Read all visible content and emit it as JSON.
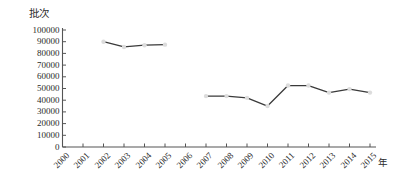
{
  "chart_data": {
    "type": "line",
    "title": "",
    "subtitle": "",
    "ylabel": "批次",
    "xlabel": "年",
    "categories": [
      "2000",
      "2001",
      "2002",
      "2003",
      "2004",
      "2005",
      "2006",
      "2007",
      "2008",
      "2009",
      "2010",
      "2011",
      "2012",
      "2013",
      "2014",
      "2015"
    ],
    "x": [
      2000,
      2001,
      2002,
      2003,
      2004,
      2005,
      2006,
      2007,
      2008,
      2009,
      2010,
      2011,
      2012,
      2013,
      2014,
      2015
    ],
    "values": [
      null,
      null,
      90000,
      85500,
      87000,
      87500,
      null,
      43500,
      43500,
      42000,
      35000,
      52500,
      52500,
      46500,
      49500,
      46500
    ],
    "series": [
      {
        "name": "批次",
        "values": [
          null,
          null,
          90000,
          85500,
          87000,
          87500,
          null,
          43500,
          43500,
          42000,
          35000,
          52500,
          52500,
          46500,
          49500,
          46500
        ]
      }
    ],
    "ytick_labels": [
      "0",
      "10000",
      "20000",
      "30000",
      "40000",
      "50000",
      "60000",
      "70000",
      "80000",
      "90000",
      "100000"
    ],
    "ytick_values": [
      0,
      10000,
      20000,
      30000,
      40000,
      50000,
      60000,
      70000,
      80000,
      90000,
      100000
    ],
    "ylim": [
      0,
      100000
    ],
    "xlim": [
      2000,
      2015
    ],
    "grid": false,
    "legend": false,
    "legend_position": "none",
    "line_color": "#3a3a3a",
    "marker_color": "#dcdcdc",
    "axis_color": "#555555",
    "background_color": "#ffffff",
    "marker_shape": "circle",
    "annotations": []
  }
}
